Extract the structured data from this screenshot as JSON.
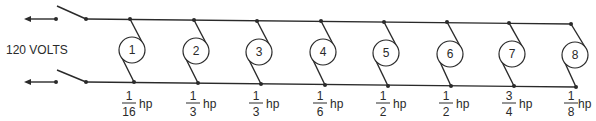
{
  "diagram": {
    "voltage_label": "120 VOLTS",
    "unit": "hp",
    "colors": {
      "ink": "#2a2a2a",
      "background": "#ffffff"
    },
    "motors": [
      {
        "number": "1",
        "numerator": "1",
        "denominator": "16"
      },
      {
        "number": "2",
        "numerator": "1",
        "denominator": "3"
      },
      {
        "number": "3",
        "numerator": "1",
        "denominator": "3"
      },
      {
        "number": "4",
        "numerator": "1",
        "denominator": "6"
      },
      {
        "number": "5",
        "numerator": "1",
        "denominator": "2"
      },
      {
        "number": "6",
        "numerator": "1",
        "denominator": "2"
      },
      {
        "number": "7",
        "numerator": "3",
        "denominator": "4"
      },
      {
        "number": "8",
        "numerator": "1",
        "denominator": "8"
      }
    ]
  }
}
